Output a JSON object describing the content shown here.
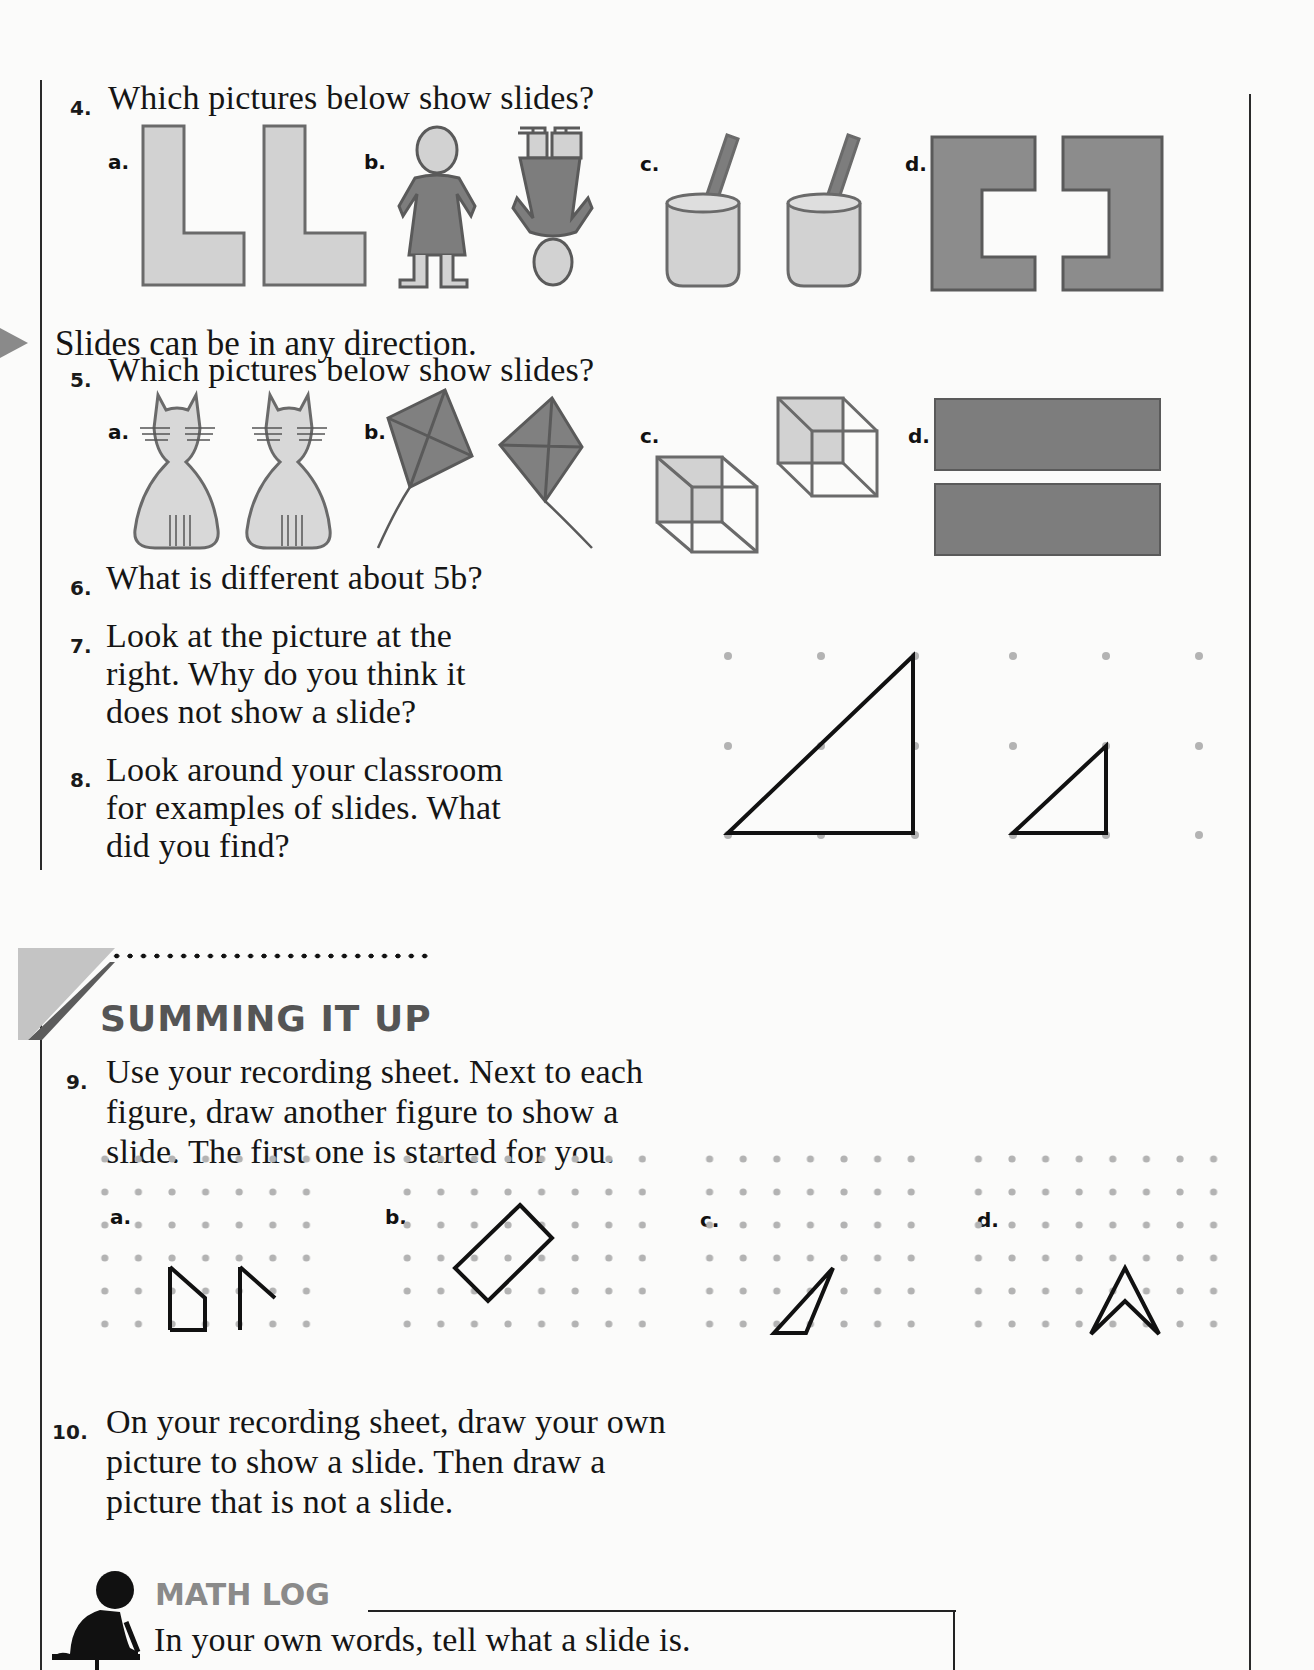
{
  "questions": {
    "q4": {
      "number": "4.",
      "text": "Which pictures below show slides?",
      "options": [
        {
          "label": "a.",
          "figure": "two-L-shapes"
        },
        {
          "label": "b.",
          "figure": "girl-upright-and-upside-down"
        },
        {
          "label": "c.",
          "figure": "cups-with-straws"
        },
        {
          "label": "d.",
          "figure": "two-C-shapes-facing"
        }
      ]
    },
    "note": "Slides can be in any direction.",
    "q5": {
      "number": "5.",
      "text": "Which pictures below show slides?",
      "options": [
        {
          "label": "a.",
          "figure": "two-cats"
        },
        {
          "label": "b.",
          "figure": "two-kites-mirrored"
        },
        {
          "label": "c.",
          "figure": "two-cubes"
        },
        {
          "label": "d.",
          "figure": "two-rectangles"
        }
      ]
    },
    "q6": {
      "number": "6.",
      "text": "What is different about 5b?"
    },
    "q7": {
      "number": "7.",
      "lines": [
        "Look at the picture at the",
        "right. Why do you think it",
        "does not show a slide?"
      ]
    },
    "q8": {
      "number": "8.",
      "lines": [
        "Look around your classroom",
        "for examples of slides. What",
        "did you find?"
      ]
    },
    "section": {
      "title": "SUMMING IT UP"
    },
    "q9": {
      "number": "9.",
      "lines": [
        "Use your recording sheet. Next to each",
        "figure, draw another figure to show a",
        "slide. The first one is started for you."
      ],
      "options": [
        {
          "label": "a."
        },
        {
          "label": "b."
        },
        {
          "label": "c."
        },
        {
          "label": "d."
        }
      ]
    },
    "q10": {
      "number": "10.",
      "lines": [
        "On your recording sheet, draw your own",
        "picture to show a slide. Then draw a",
        "picture that is not a slide."
      ]
    },
    "math_log": {
      "title": "MATH LOG",
      "prompt": "In your own words, tell what a slide is."
    }
  },
  "colors": {
    "light_fill": "#d2d2d2",
    "dark_fill": "#7d7d7d",
    "outline": "#6a6a6a",
    "dot": "#b3b3b3"
  }
}
